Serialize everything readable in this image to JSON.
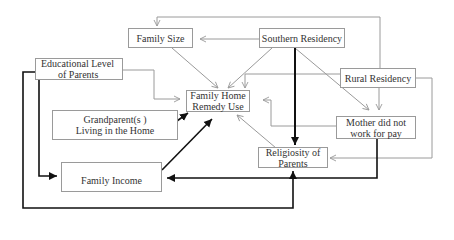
{
  "diagram": {
    "nodes": {
      "family_size": {
        "label": "Family Size"
      },
      "southern_residency": {
        "label": "Southern Residency"
      },
      "educational_level": {
        "line1": "Educational Level",
        "line2": "of Parents"
      },
      "rural_residency": {
        "label": "Rural Residency"
      },
      "family_home_remedy": {
        "line1": "Family Home",
        "line2": "Remedy Use"
      },
      "grandparents": {
        "line1": "Grandparent(s )",
        "line2": "Living in the Home"
      },
      "mother_work": {
        "line1": "Mother did not",
        "line2": "work for pay"
      },
      "religiosity": {
        "line1": "Religiosity of",
        "line2": "Parents"
      },
      "family_income": {
        "label": "Family Income"
      }
    },
    "edges": [
      {
        "from": "Southern Residency",
        "to": "Family Size",
        "weight": "thin"
      },
      {
        "from": "Rural Residency",
        "to": "Family Size",
        "weight": "thin"
      },
      {
        "from": "Family Size",
        "to": "Family Home Remedy Use",
        "weight": "thin"
      },
      {
        "from": "Southern Residency",
        "to": "Family Home Remedy Use",
        "weight": "thin"
      },
      {
        "from": "Southern Residency",
        "to": "Religiosity of Parents",
        "weight": "bold"
      },
      {
        "from": "Southern Residency",
        "to": "Mother did not work for pay",
        "weight": "thin"
      },
      {
        "from": "Rural Residency",
        "to": "Family Home Remedy Use",
        "weight": "thin"
      },
      {
        "from": "Rural Residency",
        "to": "Mother did not work for pay",
        "weight": "thin"
      },
      {
        "from": "Rural Residency",
        "to": "Religiosity of Parents",
        "weight": "thin"
      },
      {
        "from": "Educational Level of Parents",
        "to": "Family Home Remedy Use",
        "weight": "thin"
      },
      {
        "from": "Educational Level of Parents",
        "to": "Family Income",
        "weight": "bold"
      },
      {
        "from": "Educational Level of Parents",
        "to": "Religiosity of Parents",
        "weight": "bold"
      },
      {
        "from": "Grandparent(s) Living in the Home",
        "to": "Family Home Remedy Use",
        "weight": "bold"
      },
      {
        "from": "Family Income",
        "to": "Family Home Remedy Use",
        "weight": "bold"
      },
      {
        "from": "Mother did not work for pay",
        "to": "Family Home Remedy Use",
        "weight": "thin"
      },
      {
        "from": "Mother did not work for pay",
        "to": "Family Income",
        "weight": "bold"
      },
      {
        "from": "Religiosity of Parents",
        "to": "Family Home Remedy Use",
        "weight": "thin"
      }
    ]
  }
}
